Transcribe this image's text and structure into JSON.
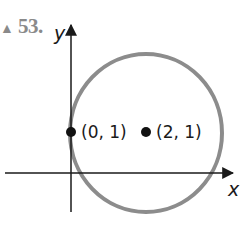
{
  "problem": {
    "number": "53."
  },
  "axes": {
    "x_label": "x",
    "y_label": "y"
  },
  "circle": {
    "center_label": "(2, 1)",
    "point_label": "(0, 1)",
    "stroke_color": "#8c8c8c"
  },
  "colors": {
    "axis": "#1a1a1a",
    "point": "#111111",
    "circle": "#8c8c8c",
    "number": "#8a8a8a"
  }
}
